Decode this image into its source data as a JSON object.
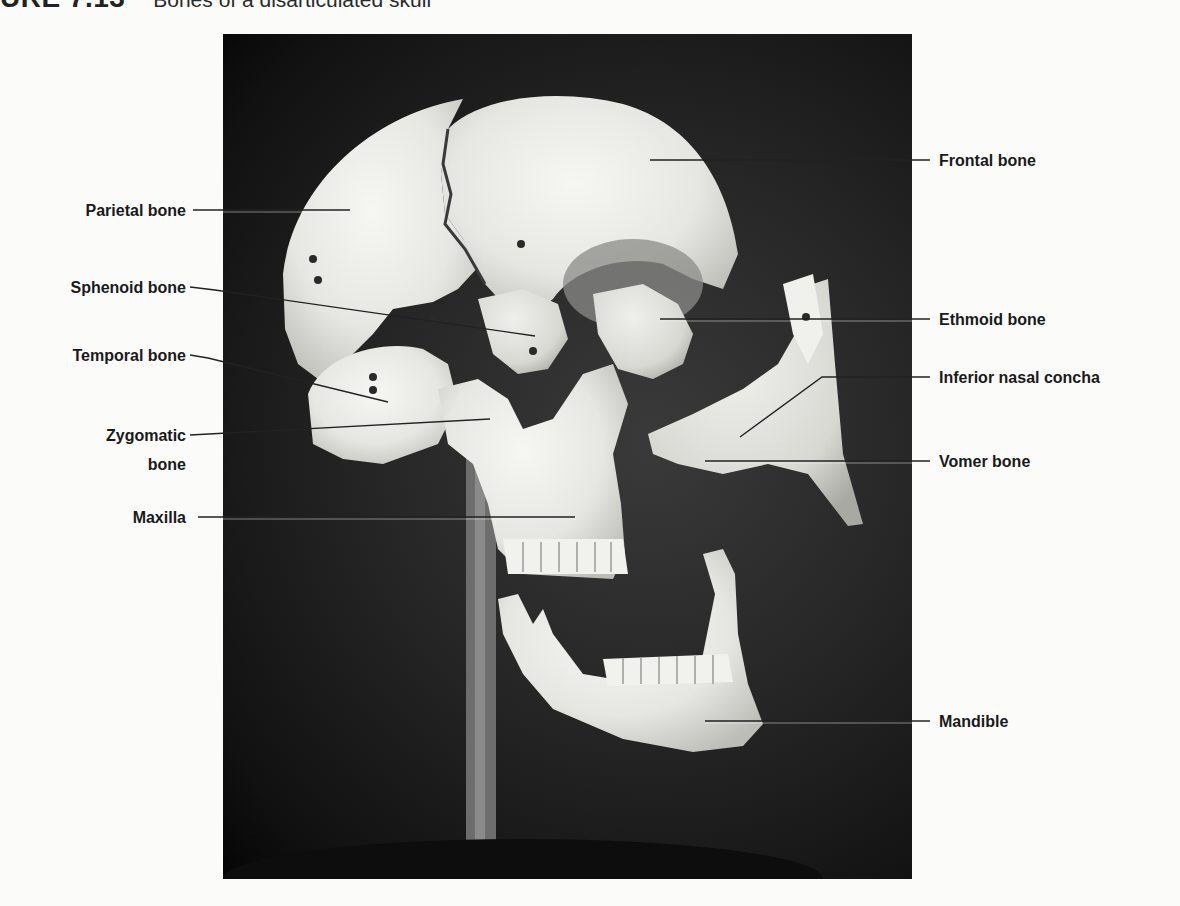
{
  "caption": {
    "figure_number": "URE 7.13",
    "title": "Bones of a disarticulated skull"
  },
  "labels": {
    "left": [
      {
        "text": "Parietal bone"
      },
      {
        "text": "Sphenoid bone"
      },
      {
        "text": "Temporal bone"
      },
      {
        "text": "Zygomatic"
      },
      {
        "text": "bone"
      },
      {
        "text": "Maxilla"
      }
    ],
    "right": [
      {
        "text": "Frontal bone"
      },
      {
        "text": "Ethmoid bone"
      },
      {
        "text": "Inferior nasal concha"
      },
      {
        "text": "Vomer bone"
      },
      {
        "text": "Mandible"
      }
    ]
  },
  "colors": {
    "background": "#fbfbfa",
    "photo_bg": "#1c1c1c",
    "bone": "#e9e9e6",
    "leader_line": "#222222",
    "label_text": "#1a1a1a"
  }
}
